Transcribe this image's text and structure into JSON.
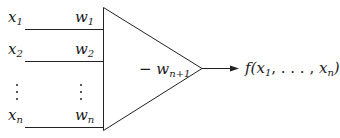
{
  "diagram": {
    "type": "perceptron / threshold unit",
    "inputs": [
      {
        "var": "x",
        "sub": "1",
        "weight_var": "w",
        "weight_sub": "1"
      },
      {
        "var": "x",
        "sub": "2",
        "weight_var": "w",
        "weight_sub": "2"
      },
      {
        "var": "x",
        "sub": "n",
        "weight_var": "w",
        "weight_sub": "n"
      }
    ],
    "ellipsis": "⋮",
    "threshold": {
      "sign": "−",
      "var": "w",
      "sub": "n+1"
    },
    "output": {
      "prefix": "f(",
      "var1": "x",
      "sub1": "1",
      "sep": ", . . . , ",
      "var2": "x",
      "sub2": "n",
      "suffix": ")"
    },
    "colors": {
      "stroke": "#222222",
      "text": "#1a1a1a",
      "background": "#ffffff"
    }
  }
}
